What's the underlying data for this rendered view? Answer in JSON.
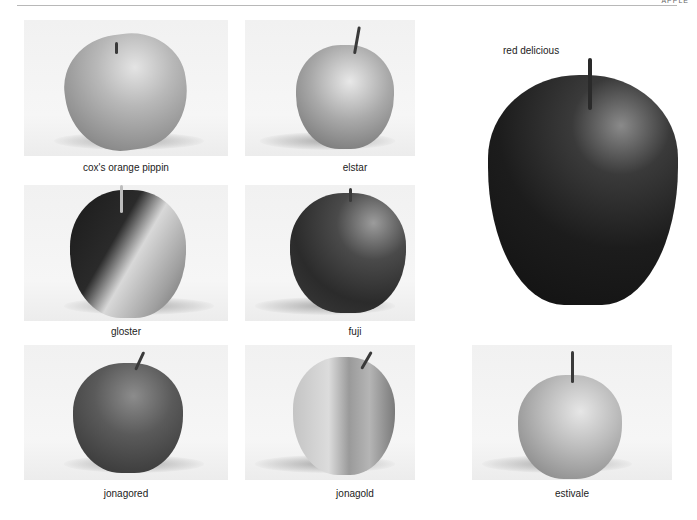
{
  "page": {
    "running_head": "APPLE",
    "background": "#ffffff"
  },
  "apples": [
    {
      "name": "cox's orange pippin",
      "tone": "light-grey"
    },
    {
      "name": "elstar",
      "tone": "light-grey"
    },
    {
      "name": "red delicious",
      "tone": "dark"
    },
    {
      "name": "gloster",
      "tone": "dark-and-light"
    },
    {
      "name": "fuji",
      "tone": "dark-grey"
    },
    {
      "name": "jonagored",
      "tone": "dark-grey"
    },
    {
      "name": "jonagold",
      "tone": "light-grey"
    },
    {
      "name": "estivale",
      "tone": "light-grey"
    }
  ]
}
